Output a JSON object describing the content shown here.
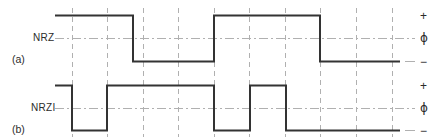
{
  "figure": {
    "width": 440,
    "height": 139,
    "background": "#ffffff",
    "trace_color": "#333333",
    "grid_color": "#b0b0b0",
    "text_color": "#2b2b2b"
  },
  "labels": {
    "nrz": "NRZ",
    "nrzi": "NRZI",
    "part_a": "(a)",
    "part_b": "(b)",
    "level_high": "+",
    "level_mid": "ϕ",
    "level_low": "−"
  },
  "grid": {
    "visible": true,
    "style": "dashed",
    "x_positions": [
      72,
      107,
      143,
      178,
      214,
      249,
      285,
      320,
      356,
      392
    ],
    "top": 8,
    "bottom": 137
  },
  "chart_data": {
    "type": "line",
    "title": "",
    "xlabel": "",
    "ylabel": "",
    "bit_period": 35.5,
    "x_start": 55,
    "x_end": 400,
    "levels": {
      "nrz": {
        "high": 15,
        "mid": 38,
        "low": 61
      },
      "nrzi": {
        "high": 85,
        "mid": 108,
        "low": 130
      }
    },
    "series": [
      {
        "name": "NRZ",
        "label": "NRZ",
        "part": "(a)",
        "transitions_x": [
          133,
          214,
          320
        ],
        "start_level": "high",
        "segments": [
          {
            "x0": 55,
            "x1": 133,
            "level": "high"
          },
          {
            "x0": 133,
            "x1": 214,
            "level": "low"
          },
          {
            "x0": 214,
            "x1": 320,
            "level": "high"
          },
          {
            "x0": 320,
            "x1": 400,
            "level": "low"
          }
        ]
      },
      {
        "name": "NRZI",
        "label": "NRZI",
        "part": "(b)",
        "transitions_x": [
          72,
          107,
          214,
          250,
          286
        ],
        "start_level": "high",
        "segments": [
          {
            "x0": 55,
            "x1": 72,
            "level": "high"
          },
          {
            "x0": 72,
            "x1": 107,
            "level": "low"
          },
          {
            "x0": 107,
            "x1": 214,
            "level": "high"
          },
          {
            "x0": 214,
            "x1": 250,
            "level": "low"
          },
          {
            "x0": 250,
            "x1": 286,
            "level": "high"
          },
          {
            "x0": 286,
            "x1": 400,
            "level": "low"
          }
        ]
      }
    ]
  }
}
